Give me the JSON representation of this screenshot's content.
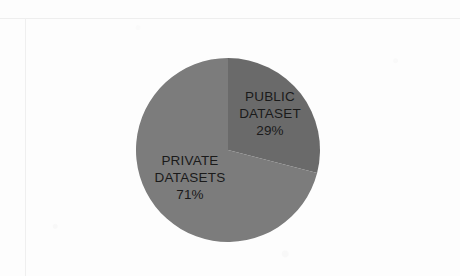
{
  "page": {
    "background_color": "#fdfdfd",
    "frame_color": "#eeeeee"
  },
  "chart_data": {
    "type": "pie",
    "title": "",
    "subtitle": "",
    "xlabel": "",
    "ylabel": "",
    "legend_position": "none",
    "grid": false,
    "start_angle_deg": 0,
    "direction": "clockwise",
    "categories": [
      "PUBLIC DATASET",
      "PRIVATE DATASETS"
    ],
    "values": [
      29,
      71
    ],
    "unit": "%",
    "slices": [
      {
        "name": "public-dataset",
        "label_line1": "PUBLIC",
        "label_line2": "DATASET",
        "value": 29,
        "value_label": "29%",
        "color": "#6b6b6b",
        "angle_deg": 104.4
      },
      {
        "name": "private-datasets",
        "label_line1": "PRIVATE",
        "label_line2": "DATASETS",
        "value": 71,
        "value_label": "71%",
        "color": "#7b7b7b",
        "angle_deg": 255.6
      }
    ],
    "geometry": {
      "center_x": 228,
      "center_y": 150,
      "radius": 92
    }
  }
}
